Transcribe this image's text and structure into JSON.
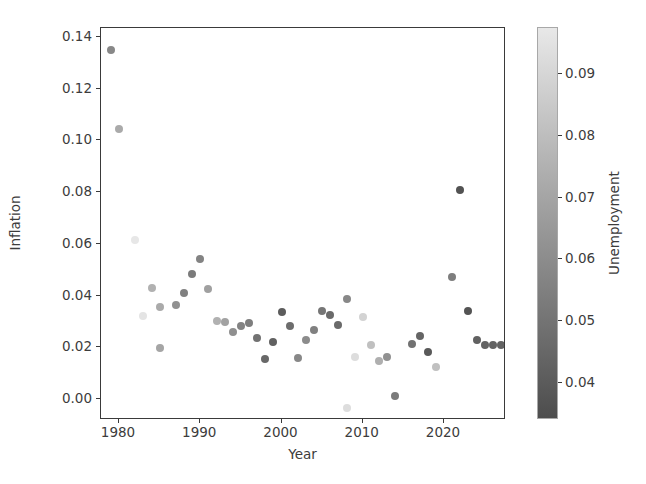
{
  "chart_data": {
    "type": "scatter",
    "title": "",
    "xlabel": "Year",
    "ylabel": "Inflation",
    "colorbar_label": "Unemployment",
    "colormap": "gray_r",
    "grid": false,
    "legend": null,
    "xlim": [
      1978.2,
      1978.2
    ],
    "ylim": [
      -0.0105,
      0.1465
    ],
    "xticks": [
      1980,
      1990,
      2000,
      2010,
      2020
    ],
    "xtick_labels": [
      "1980",
      "1990",
      "2000",
      "2010",
      "2020"
    ],
    "yticks": [
      0.0,
      0.02,
      0.04,
      0.06,
      0.08,
      0.1,
      0.12,
      0.14
    ],
    "ytick_labels": [
      "0.00",
      "0.02",
      "0.04",
      "0.06",
      "0.08",
      "0.10",
      "0.12",
      "0.14"
    ],
    "colorbar_ticks": [
      0.04,
      0.05,
      0.06,
      0.07,
      0.08,
      0.09
    ],
    "colorbar_tick_labels": [
      "0.04",
      "0.05",
      "0.06",
      "0.07",
      "0.08",
      "0.09"
    ],
    "colorbar_range": [
      0.034,
      0.0975
    ],
    "x_name": "Year",
    "y_name": "Inflation",
    "c_name": "Unemployment",
    "points": [
      {
        "x": 1979,
        "y": 0.135,
        "c": 0.058
      },
      {
        "x": 1980,
        "y": 0.1045,
        "c": 0.072
      },
      {
        "x": 1982,
        "y": 0.0615,
        "c": 0.097
      },
      {
        "x": 1983,
        "y": 0.032,
        "c": 0.096
      },
      {
        "x": 1984,
        "y": 0.043,
        "c": 0.075
      },
      {
        "x": 1985,
        "y": 0.0355,
        "c": 0.072
      },
      {
        "x": 1985,
        "y": 0.0197,
        "c": 0.07
      },
      {
        "x": 1987,
        "y": 0.0365,
        "c": 0.062
      },
      {
        "x": 1988,
        "y": 0.041,
        "c": 0.055
      },
      {
        "x": 1989,
        "y": 0.0482,
        "c": 0.053
      },
      {
        "x": 1990,
        "y": 0.054,
        "c": 0.056
      },
      {
        "x": 1991,
        "y": 0.0425,
        "c": 0.068
      },
      {
        "x": 1992,
        "y": 0.0303,
        "c": 0.075
      },
      {
        "x": 1993,
        "y": 0.0299,
        "c": 0.069
      },
      {
        "x": 1994,
        "y": 0.0261,
        "c": 0.061
      },
      {
        "x": 1995,
        "y": 0.0281,
        "c": 0.056
      },
      {
        "x": 1996,
        "y": 0.0293,
        "c": 0.054
      },
      {
        "x": 1997,
        "y": 0.0234,
        "c": 0.049
      },
      {
        "x": 1998,
        "y": 0.0155,
        "c": 0.045
      },
      {
        "x": 1999,
        "y": 0.0219,
        "c": 0.042
      },
      {
        "x": 2000,
        "y": 0.0338,
        "c": 0.04
      },
      {
        "x": 2001,
        "y": 0.0283,
        "c": 0.047
      },
      {
        "x": 2002,
        "y": 0.0159,
        "c": 0.058
      },
      {
        "x": 2003,
        "y": 0.0227,
        "c": 0.06
      },
      {
        "x": 2004,
        "y": 0.0268,
        "c": 0.055
      },
      {
        "x": 2005,
        "y": 0.0339,
        "c": 0.051
      },
      {
        "x": 2006,
        "y": 0.0323,
        "c": 0.046
      },
      {
        "x": 2007,
        "y": 0.0285,
        "c": 0.046
      },
      {
        "x": 2008,
        "y": 0.0385,
        "c": 0.058
      },
      {
        "x": 2008,
        "y": -0.0035,
        "c": 0.093
      },
      {
        "x": 2009,
        "y": 0.0164,
        "c": 0.093
      },
      {
        "x": 2010,
        "y": 0.0316,
        "c": 0.089
      },
      {
        "x": 2011,
        "y": 0.0207,
        "c": 0.081
      },
      {
        "x": 2012,
        "y": 0.0146,
        "c": 0.074
      },
      {
        "x": 2013,
        "y": 0.0162,
        "c": 0.062
      },
      {
        "x": 2014,
        "y": 0.0012,
        "c": 0.053
      },
      {
        "x": 2016,
        "y": 0.0213,
        "c": 0.049
      },
      {
        "x": 2017,
        "y": 0.0244,
        "c": 0.044
      },
      {
        "x": 2018,
        "y": 0.0181,
        "c": 0.039
      },
      {
        "x": 2019,
        "y": 0.0123,
        "c": 0.081
      },
      {
        "x": 2021,
        "y": 0.047,
        "c": 0.054
      },
      {
        "x": 2022,
        "y": 0.081,
        "c": 0.036
      },
      {
        "x": 2023,
        "y": 0.0342,
        "c": 0.037
      },
      {
        "x": 2024,
        "y": 0.0228,
        "c": 0.042
      },
      {
        "x": 2025,
        "y": 0.021,
        "c": 0.043
      },
      {
        "x": 2026,
        "y": 0.0208,
        "c": 0.043
      },
      {
        "x": 2027,
        "y": 0.0207,
        "c": 0.043
      }
    ]
  },
  "axes": {
    "xlabel": "Year",
    "ylabel": "Inflation"
  },
  "colorbar": {
    "label": "Unemployment"
  },
  "colors": {
    "axis_line": "#3a3a3a",
    "tick_text": "#3c3c3c",
    "background": "#ffffff",
    "cmap_low": "#4d4d4d",
    "cmap_high": "#e8e8e8"
  }
}
